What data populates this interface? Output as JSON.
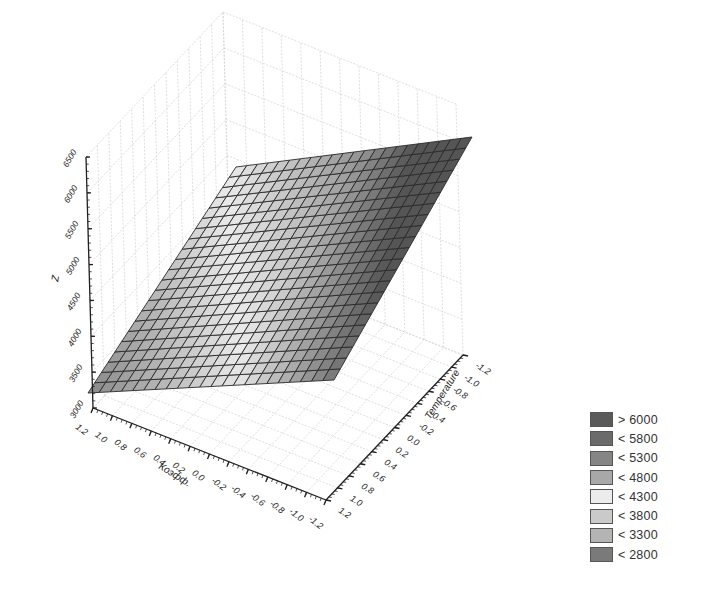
{
  "chart_data": {
    "type": "surface3d",
    "title": "",
    "xlabel": "Коэфф.",
    "ylabel": "Temperature",
    "zlabel": "Z",
    "x_ticks": [
      "1.2",
      "1.0",
      "0.8",
      "0.6",
      "0.4",
      "0.2",
      "0.0",
      "-0.2",
      "-0.4",
      "-0.6",
      "-0.8",
      "-1.0",
      "-1.2"
    ],
    "y_ticks": [
      "1.2",
      "1.0",
      "0.8",
      "0.6",
      "0.4",
      "0.2",
      "0.0",
      "-0.2",
      "-0.4",
      "-0.6",
      "-0.8",
      "-1.0",
      "-1.2"
    ],
    "z_ticks": [
      "3000",
      "3500",
      "4000",
      "4500",
      "5000",
      "5500",
      "6000",
      "6500"
    ],
    "xlim": [
      -1.2,
      1.2
    ],
    "ylim": [
      -1.2,
      1.2
    ],
    "zlim": [
      3000,
      6500
    ],
    "surface_corners": [
      {
        "x": 1.2,
        "y": 1.2,
        "z": 3000
      },
      {
        "x": 1.2,
        "y": -1.2,
        "z": 4800
      },
      {
        "x": -1.2,
        "y": -1.2,
        "z": 6100
      },
      {
        "x": -1.2,
        "y": 1.2,
        "z": 4300
      }
    ],
    "grid_resolution": 20,
    "grid": true,
    "legend_position": "bottom-right",
    "legend": [
      {
        "label": "> 6000",
        "color": "#5a5a5a"
      },
      {
        "label": "< 5800",
        "color": "#6b6b6b"
      },
      {
        "label": "< 5300",
        "color": "#858585"
      },
      {
        "label": "< 4800",
        "color": "#a8a8a8"
      },
      {
        "label": "< 4300",
        "color": "#ececec"
      },
      {
        "label": "< 3800",
        "color": "#cacaca"
      },
      {
        "label": "< 3300",
        "color": "#b4b4b4"
      },
      {
        "label": "< 2800",
        "color": "#7a7a7a"
      }
    ]
  }
}
